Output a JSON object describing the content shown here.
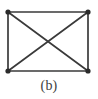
{
  "figure": {
    "caption": "(b)",
    "background_color": "#ffffff",
    "edge_color": "#3a3a3a",
    "vertex_color": "#2b2b2b",
    "caption_color": "#3d3d3d",
    "graph_name": "complete-graph-k4",
    "vertex_count": 4,
    "edge_count": 6,
    "vertices": [
      {
        "id": "top-left",
        "cx": 8,
        "cy": 12,
        "r": 2.6
      },
      {
        "id": "top-right",
        "cx": 88,
        "cy": 12,
        "r": 2.6
      },
      {
        "id": "bottom-left",
        "cx": 8,
        "cy": 71,
        "r": 2.6
      },
      {
        "id": "bottom-right",
        "cx": 88,
        "cy": 71,
        "r": 2.6
      }
    ],
    "edges": [
      {
        "id": "edge-top",
        "from": "top-left",
        "to": "top-right",
        "x1": 8,
        "y1": 12,
        "x2": 88,
        "y2": 12
      },
      {
        "id": "edge-right",
        "from": "top-right",
        "to": "bottom-right",
        "x1": 88,
        "y1": 12,
        "x2": 88,
        "y2": 71
      },
      {
        "id": "edge-bottom",
        "from": "bottom-left",
        "to": "bottom-right",
        "x1": 8,
        "y1": 71,
        "x2": 88,
        "y2": 71
      },
      {
        "id": "edge-left",
        "from": "top-left",
        "to": "bottom-left",
        "x1": 8,
        "y1": 12,
        "x2": 8,
        "y2": 71
      },
      {
        "id": "edge-diagonal-tl-br",
        "from": "top-left",
        "to": "bottom-right",
        "x1": 8,
        "y1": 12,
        "x2": 88,
        "y2": 71
      },
      {
        "id": "edge-diagonal-tr-bl",
        "from": "top-right",
        "to": "bottom-left",
        "x1": 88,
        "y1": 12,
        "x2": 8,
        "y2": 71
      }
    ],
    "crossing_point": {
      "x": 48,
      "y": 41.5
    }
  }
}
